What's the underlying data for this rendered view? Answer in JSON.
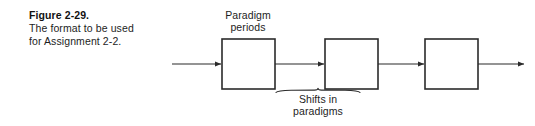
{
  "figure": {
    "number": "Figure 2-29.",
    "description_line1": "The format to be used",
    "description_line2": "for Assignment 2-2."
  },
  "diagram": {
    "type": "block-flow",
    "labels": {
      "top_line1": "Paradigm",
      "top_line2": "periods",
      "bottom_line1": "Shifts in",
      "bottom_line2": "paradigms"
    },
    "boxes": [
      {
        "id": "box-1",
        "label": "",
        "x": 222,
        "y": 39,
        "width": 53,
        "height": 50
      },
      {
        "id": "box-2",
        "label": "",
        "x": 325,
        "y": 39,
        "width": 53,
        "height": 50
      },
      {
        "id": "box-3",
        "label": "",
        "x": 425,
        "y": 39,
        "width": 53,
        "height": 50
      }
    ],
    "connectors": [
      {
        "id": "arrow-in",
        "from_x": 172,
        "to_x": 222,
        "y": 64
      },
      {
        "id": "arrow-1-2",
        "from_x": 275,
        "to_x": 325,
        "y": 64
      },
      {
        "id": "arrow-2-3",
        "from_x": 378,
        "to_x": 425,
        "y": 64
      },
      {
        "id": "arrow-out",
        "from_x": 478,
        "to_x": 525,
        "y": 64
      }
    ],
    "brace": {
      "id": "brace-shifts",
      "left_x": 276,
      "right_x": 360,
      "y": 92,
      "peak_x": 318
    },
    "colors": {
      "background": "#ffffff",
      "stroke": "#2b2b2b",
      "box_fill": "#ffffff",
      "text": "#1d1d1d"
    }
  }
}
